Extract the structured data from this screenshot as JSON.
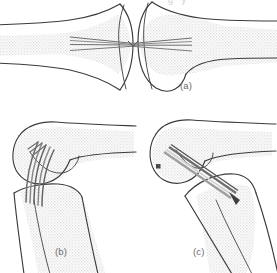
{
  "figure": {
    "kind": "anatomical-line-drawing",
    "width": 277,
    "height": 273,
    "background_color": "#ffffff",
    "outline_color": "#3b3b3b",
    "bone_fill_color": "#eeeeee",
    "stipple_color": "#e3e3e3",
    "pin_color": "#7d7d7d",
    "pin_highlight_color": "#d8d8d8",
    "label_color": "#6a6a6a",
    "marker_color": "#4a4a4a"
  },
  "topcrop": {
    "partial_text": "g     y"
  },
  "panels": [
    {
      "id": "a",
      "label": "(a)",
      "view": "anteroposterior joint view, two opposed bone ends",
      "label_x": 180,
      "label_y": 80,
      "pin_count": 4,
      "pin_orientation": "horizontal, converging to an apex at the joint line",
      "pin_apex_x": 133,
      "pin_apex_y": 44
    },
    {
      "id": "b",
      "label": "(b)",
      "view": "lateral knee view, pins entering anteriorly and fanning proximally",
      "label_x": 55,
      "label_y": 246,
      "pin_count": 5,
      "pin_orientation": "near vertical, fanning out superiorly",
      "has_marker": false
    },
    {
      "id": "c",
      "label": "(c)",
      "view": "oblique knee view with single thick pin bundle crossing the joint",
      "label_x": 193,
      "label_y": 246,
      "pin_count": 3,
      "pin_orientation": "oblique, upper-left to lower-right across the joint",
      "has_marker": true,
      "marker_shape": "square",
      "marker_x": 158,
      "marker_y": 166
    }
  ]
}
